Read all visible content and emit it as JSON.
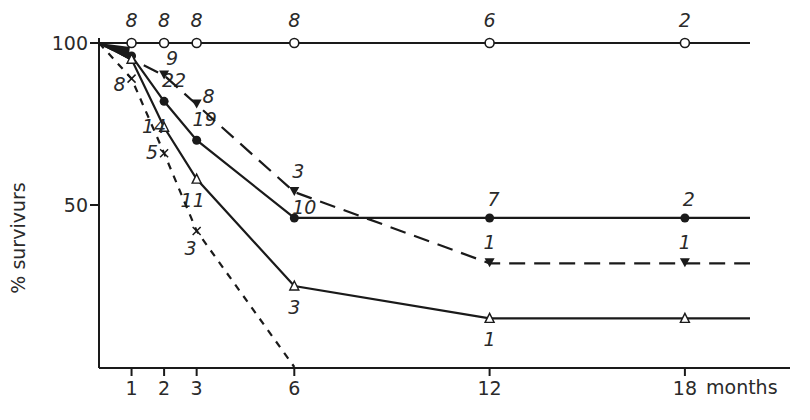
{
  "chart_data": {
    "type": "line",
    "title": "",
    "xlabel": "months",
    "ylabel": "% survivurs",
    "xlim": [
      0,
      20
    ],
    "ylim": [
      0,
      100
    ],
    "x_ticks": [
      1,
      2,
      3,
      6,
      12,
      18
    ],
    "y_ticks": [
      50,
      100
    ],
    "grid": false,
    "legend": "none",
    "series": [
      {
        "name": "open-circles",
        "marker": "open-circle",
        "line": "solid",
        "x": [
          0,
          1,
          2,
          3,
          6,
          12,
          18,
          20
        ],
        "y": [
          100,
          100,
          100,
          100,
          100,
          100,
          100,
          100
        ],
        "point_labels": [
          {
            "x": 1,
            "label": "8"
          },
          {
            "x": 2,
            "label": "8"
          },
          {
            "x": 3,
            "label": "8"
          },
          {
            "x": 6,
            "label": "8"
          },
          {
            "x": 12,
            "label": "6"
          },
          {
            "x": 18,
            "label": "2"
          }
        ]
      },
      {
        "name": "filled-circles",
        "marker": "filled-circle",
        "line": "solid",
        "x": [
          0,
          1,
          2,
          3,
          6,
          12,
          18,
          20
        ],
        "y": [
          100,
          96,
          82,
          70,
          46,
          46,
          46,
          46
        ],
        "point_labels": [
          {
            "x": 2,
            "label": "22"
          },
          {
            "x": 3,
            "label": "19"
          },
          {
            "x": 6,
            "label": "10"
          },
          {
            "x": 12,
            "label": "7"
          },
          {
            "x": 18,
            "label": "2"
          }
        ]
      },
      {
        "name": "filled-triangles",
        "marker": "filled-triangle-down",
        "line": "long-dash",
        "x": [
          0,
          2,
          3,
          6,
          12,
          18,
          20
        ],
        "y": [
          100,
          90,
          81,
          54,
          32,
          32,
          32
        ],
        "point_labels": [
          {
            "x": 2,
            "label": "9"
          },
          {
            "x": 3,
            "label": "8"
          },
          {
            "x": 6,
            "label": "3"
          },
          {
            "x": 12,
            "label": "1"
          },
          {
            "x": 18,
            "label": "1"
          }
        ]
      },
      {
        "name": "open-triangles",
        "marker": "open-triangle",
        "line": "solid",
        "x": [
          0,
          1,
          2,
          3,
          6,
          12,
          18,
          20
        ],
        "y": [
          100,
          95,
          74,
          58,
          25,
          15,
          15,
          15
        ],
        "point_labels": [
          {
            "x": 2,
            "label": "14"
          },
          {
            "x": 3,
            "label": "11"
          },
          {
            "x": 6,
            "label": "3"
          },
          {
            "x": 12,
            "label": "1"
          }
        ]
      },
      {
        "name": "crosses",
        "marker": "cross",
        "line": "short-dash",
        "x": [
          0,
          1,
          2,
          3,
          6
        ],
        "y": [
          100,
          89,
          66,
          42,
          0
        ],
        "point_labels": [
          {
            "x": 1,
            "label": "8"
          },
          {
            "x": 2,
            "label": "5"
          },
          {
            "x": 3,
            "label": "3"
          }
        ]
      }
    ],
    "annotations": [
      {
        "x": 1,
        "y": 97,
        "label": "3"
      }
    ]
  },
  "axes": {
    "y_tick_100": "100",
    "y_tick_50": "50",
    "y_title": "% survivurs",
    "x_ticks": [
      "1",
      "2",
      "3",
      "6",
      "12",
      "18"
    ],
    "x_title": "months"
  },
  "colors": {
    "ink": "#1a1a1a",
    "background": "#ffffff"
  }
}
